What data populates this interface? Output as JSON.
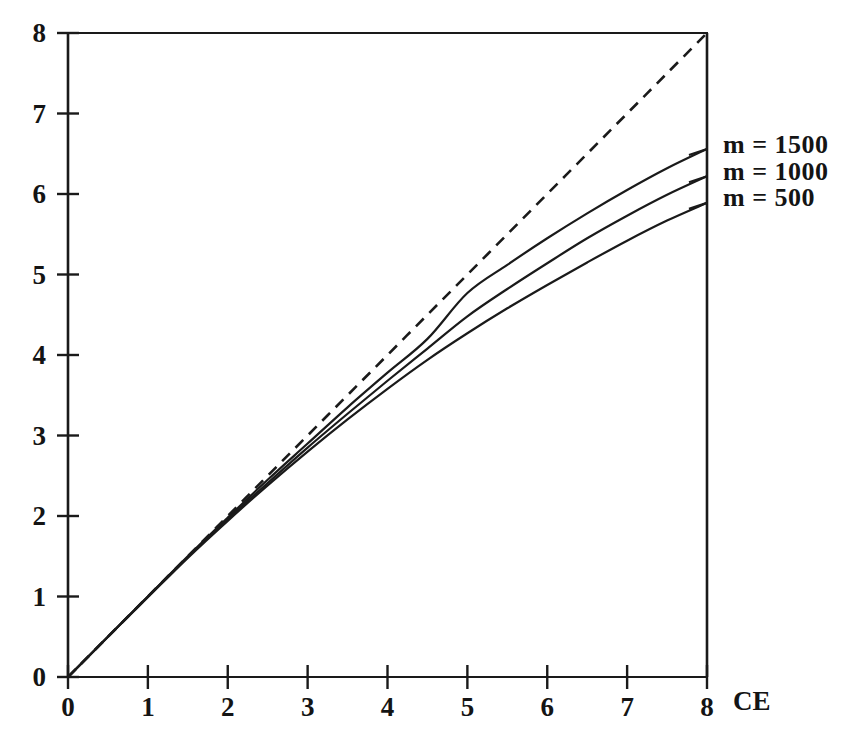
{
  "chart_data": {
    "type": "line",
    "title": "",
    "subtitle": "",
    "xlabel": "CE",
    "ylabel": "",
    "xlim": [
      0,
      8
    ],
    "ylim": [
      0,
      8
    ],
    "xticks": [
      "0",
      "1",
      "2",
      "3",
      "4",
      "5",
      "6",
      "7",
      "8"
    ],
    "yticks": [
      "0",
      "1",
      "2",
      "3",
      "4",
      "5",
      "6",
      "7",
      "8"
    ],
    "xtick_values": [
      0,
      1,
      2,
      3,
      4,
      5,
      6,
      7,
      8
    ],
    "ytick_values": [
      0,
      1,
      2,
      3,
      4,
      5,
      6,
      7,
      8
    ],
    "grid": false,
    "legend_position": "right-outside",
    "x": [
      0,
      0.5,
      1,
      1.5,
      2,
      2.5,
      3,
      3.5,
      4,
      4.5,
      5,
      5.5,
      6,
      6.5,
      7,
      7.5,
      8
    ],
    "series": [
      {
        "name": "m = 1500",
        "style": "solid",
        "color": "#1a1a1a",
        "values": [
          0,
          0.5,
          1.0,
          1.5,
          1.98,
          2.45,
          2.9,
          3.35,
          3.78,
          4.2,
          4.77,
          5.12,
          5.45,
          5.76,
          6.05,
          6.32,
          6.56
        ]
      },
      {
        "name": "m = 1000",
        "style": "solid",
        "color": "#1a1a1a",
        "values": [
          0,
          0.5,
          1.0,
          1.49,
          1.96,
          2.41,
          2.85,
          3.27,
          3.68,
          4.08,
          4.48,
          4.82,
          5.14,
          5.45,
          5.73,
          5.99,
          6.22
        ]
      },
      {
        "name": "m = 500",
        "style": "solid",
        "color": "#1a1a1a",
        "values": [
          0,
          0.5,
          0.99,
          1.48,
          1.94,
          2.38,
          2.8,
          3.2,
          3.58,
          3.94,
          4.27,
          4.58,
          4.87,
          5.15,
          5.42,
          5.67,
          5.89
        ]
      },
      {
        "name": "reference",
        "style": "dashed",
        "color": "#1a1a1a",
        "values": [
          0,
          0.5,
          1,
          1.5,
          2,
          2.5,
          3,
          3.5,
          4,
          4.5,
          5,
          5.5,
          6,
          6.5,
          7,
          7.5,
          8
        ]
      }
    ],
    "legend_entries": [
      {
        "label": "m = 1500",
        "value": 6.56
      },
      {
        "label": "m = 1000",
        "value": 6.22
      },
      {
        "label": "m = 500",
        "value": 5.89
      }
    ]
  },
  "axes": {
    "x_axis_title": "CE",
    "y_axis_title": ""
  }
}
